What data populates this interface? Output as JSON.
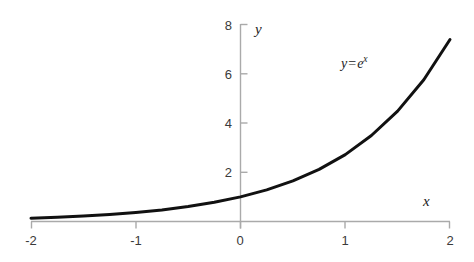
{
  "chart_data": {
    "type": "line",
    "title": "",
    "subtitle": "",
    "xlabel": "x",
    "ylabel": "y",
    "xlim": [
      -2,
      2
    ],
    "ylim": [
      0,
      8
    ],
    "grid": false,
    "legend": null,
    "xticks": [
      -2,
      -1,
      0,
      1,
      2
    ],
    "xtick_labels": [
      "-2",
      "-1",
      "0",
      "1",
      "2"
    ],
    "yticks": [
      2,
      4,
      6,
      8
    ],
    "ytick_labels": [
      "2",
      "4",
      "6",
      "8"
    ],
    "annotations": [
      {
        "name": "equation",
        "lhs": "y",
        "operator": "=",
        "base": "e",
        "exponent": "x",
        "text": "y = e^x",
        "x": 1.0,
        "y": 6.2
      }
    ],
    "series": [
      {
        "name": "y = e^x",
        "color": "#111111",
        "linewidth": 3,
        "x": [
          -2,
          -1.75,
          -1.5,
          -1.25,
          -1,
          -0.75,
          -0.5,
          -0.25,
          0,
          0.25,
          0.5,
          0.75,
          1,
          1.25,
          1.5,
          1.75,
          2
        ],
        "values": [
          0.135,
          0.174,
          0.223,
          0.287,
          0.368,
          0.472,
          0.607,
          0.779,
          1.0,
          1.284,
          1.649,
          2.117,
          2.718,
          3.49,
          4.482,
          5.755,
          7.389
        ]
      }
    ],
    "axis_color": "#aaaaaa",
    "tick_label_color": "#3a3a3a",
    "background": "#ffffff"
  },
  "labels": {
    "y_axis_name": "y",
    "x_axis_name": "x"
  }
}
